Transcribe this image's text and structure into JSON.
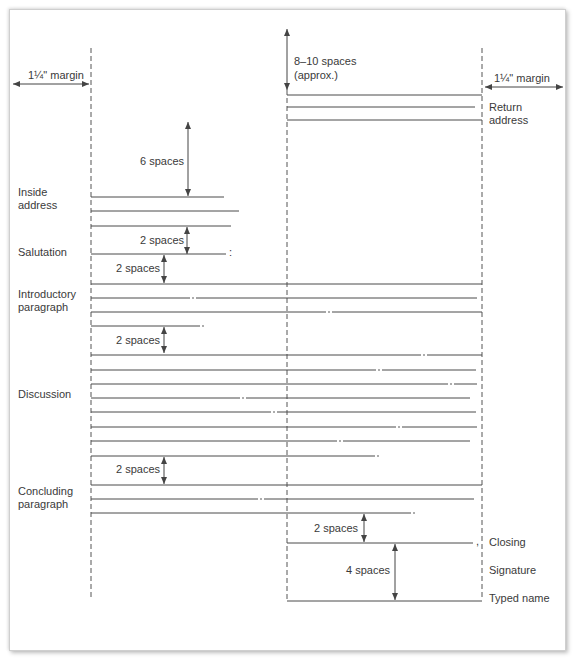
{
  "diagram": {
    "margins": {
      "left_label": "1¼\" margin",
      "right_label": "1¼\" margin"
    },
    "spacing_labels": {
      "top": "8–10 spaces",
      "top_sub": "(approx.)",
      "six": "6 spaces",
      "after_inside": "2 spaces",
      "after_salutation": "2 spaces",
      "after_intro": "2 spaces",
      "after_discussion": "2 spaces",
      "after_conclusion": "2 spaces",
      "signature_gap": "4 spaces"
    },
    "parts_left": {
      "inside_address": [
        "Inside",
        "address"
      ],
      "salutation": "Salutation",
      "introductory": [
        "Introductory",
        "paragraph"
      ],
      "discussion": "Discussion",
      "concluding": [
        "Concluding",
        "paragraph"
      ]
    },
    "parts_right": {
      "return_address": [
        "Return",
        "address"
      ],
      "closing": "Closing",
      "signature": "Signature",
      "typed_name": "Typed name"
    },
    "punctuation": {
      "salutation": ":",
      "closing": ","
    }
  }
}
